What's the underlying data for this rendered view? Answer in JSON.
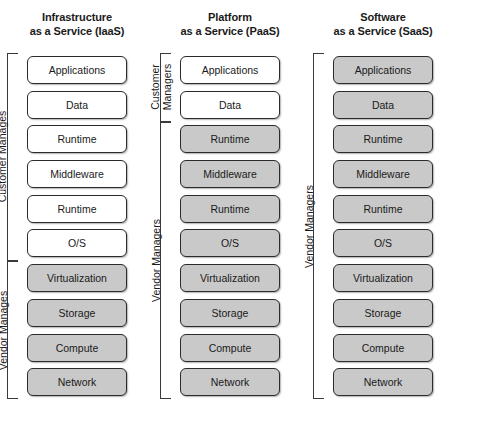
{
  "diagram": {
    "legend": {
      "customer_managed_fill": "#ffffff",
      "vendor_managed_fill": "#c9c9c9",
      "border_color": "#2b2b2b"
    },
    "layers": [
      "Applications",
      "Data",
      "Runtime",
      "Middleware",
      "Runtime",
      "O/S",
      "Virtualization",
      "Storage",
      "Compute",
      "Network"
    ],
    "columns": [
      {
        "id": "iaas",
        "title": "Infrastructure\nas a Service (IaaS)",
        "title_line1": "Infrastructure",
        "title_line2": "as a Service (IaaS)",
        "boxes": [
          {
            "label": "Applications",
            "shaded": false
          },
          {
            "label": "Data",
            "shaded": false
          },
          {
            "label": "Runtime",
            "shaded": false
          },
          {
            "label": "Middleware",
            "shaded": false
          },
          {
            "label": "Runtime",
            "shaded": false
          },
          {
            "label": "O/S",
            "shaded": false
          },
          {
            "label": "Virtualization",
            "shaded": true
          },
          {
            "label": "Storage",
            "shaded": true
          },
          {
            "label": "Compute",
            "shaded": true
          },
          {
            "label": "Network",
            "shaded": true
          }
        ],
        "brackets": [
          {
            "id": "customer",
            "label": "Customer Manages",
            "from": 1,
            "to": 6
          },
          {
            "id": "vendor",
            "label": "Vendor Manages",
            "from": 7,
            "to": 10
          }
        ]
      },
      {
        "id": "paas",
        "title": "Platform\nas a Service (PaaS)",
        "title_line1": "Platform",
        "title_line2": "as a Service (PaaS)",
        "boxes": [
          {
            "label": "Applications",
            "shaded": false
          },
          {
            "label": "Data",
            "shaded": false
          },
          {
            "label": "Runtime",
            "shaded": true
          },
          {
            "label": "Middleware",
            "shaded": true
          },
          {
            "label": "Runtime",
            "shaded": true
          },
          {
            "label": "O/S",
            "shaded": true
          },
          {
            "label": "Virtualization",
            "shaded": true
          },
          {
            "label": "Storage",
            "shaded": true
          },
          {
            "label": "Compute",
            "shaded": true
          },
          {
            "label": "Network",
            "shaded": true
          }
        ],
        "brackets": [
          {
            "id": "customer",
            "label": "Customer\nManagers",
            "from": 1,
            "to": 2
          },
          {
            "id": "vendor",
            "label": "Vendor Managers",
            "from": 3,
            "to": 10
          }
        ]
      },
      {
        "id": "saas",
        "title": "Software\nas a Service (SaaS)",
        "title_line1": "Software",
        "title_line2": "as a Service (SaaS)",
        "boxes": [
          {
            "label": "Applications",
            "shaded": true
          },
          {
            "label": "Data",
            "shaded": true
          },
          {
            "label": "Runtime",
            "shaded": true
          },
          {
            "label": "Middleware",
            "shaded": true
          },
          {
            "label": "Runtime",
            "shaded": true
          },
          {
            "label": "O/S",
            "shaded": true
          },
          {
            "label": "Virtualization",
            "shaded": true
          },
          {
            "label": "Storage",
            "shaded": true
          },
          {
            "label": "Compute",
            "shaded": true
          },
          {
            "label": "Network",
            "shaded": true
          }
        ],
        "brackets": [
          {
            "id": "vendor",
            "label": "Vendor Managers",
            "from": 1,
            "to": 10
          }
        ]
      }
    ]
  }
}
